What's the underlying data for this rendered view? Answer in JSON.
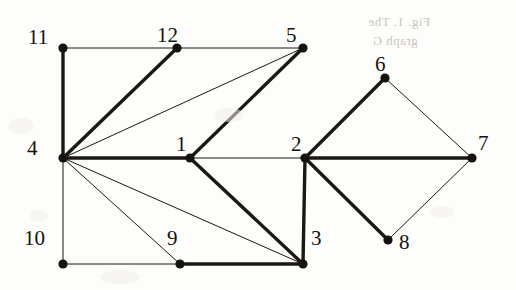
{
  "figure": {
    "type": "undirected-graph-diagram",
    "background_color": "#fdfdfb",
    "node_color": "#15120f",
    "edge_color": "#1a1714",
    "thick_edge_width": 3.4,
    "thin_edge_width": 1.0,
    "node_radius": 4.6
  },
  "nodes": [
    {
      "id": "11",
      "label": "11",
      "x": 63,
      "y": 48,
      "label_x": 28,
      "label_y": 27
    },
    {
      "id": "12",
      "label": "12",
      "x": 177,
      "y": 48,
      "label_x": 157,
      "label_y": 25
    },
    {
      "id": "5",
      "label": "5",
      "x": 303,
      "y": 48,
      "label_x": 286,
      "label_y": 25
    },
    {
      "id": "6",
      "label": "6",
      "x": 385,
      "y": 78,
      "label_x": 375,
      "label_y": 54
    },
    {
      "id": "4",
      "label": "4",
      "x": 63,
      "y": 158,
      "label_x": 27,
      "label_y": 138
    },
    {
      "id": "1",
      "label": "1",
      "x": 190,
      "y": 158,
      "label_x": 176,
      "label_y": 134
    },
    {
      "id": "2",
      "label": "2",
      "x": 305,
      "y": 158,
      "label_x": 291,
      "label_y": 134
    },
    {
      "id": "7",
      "label": "7",
      "x": 472,
      "y": 158,
      "label_x": 478,
      "label_y": 133
    },
    {
      "id": "8",
      "label": "8",
      "x": 388,
      "y": 240,
      "label_x": 399,
      "label_y": 232
    },
    {
      "id": "10",
      "label": "10",
      "x": 63,
      "y": 264,
      "label_x": 24,
      "label_y": 228
    },
    {
      "id": "9",
      "label": "9",
      "x": 180,
      "y": 264,
      "label_x": 167,
      "label_y": 228
    },
    {
      "id": "3",
      "label": "3",
      "x": 303,
      "y": 264,
      "label_x": 311,
      "label_y": 228
    }
  ],
  "edges": [
    {
      "from": "11",
      "to": "12",
      "weight": "thin"
    },
    {
      "from": "12",
      "to": "5",
      "weight": "thin"
    },
    {
      "from": "11",
      "to": "4",
      "weight": "thick"
    },
    {
      "from": "4",
      "to": "12",
      "weight": "thick"
    },
    {
      "from": "4",
      "to": "5",
      "weight": "thin"
    },
    {
      "from": "4",
      "to": "1",
      "weight": "thick"
    },
    {
      "from": "4",
      "to": "9",
      "weight": "thin"
    },
    {
      "from": "4",
      "to": "3",
      "weight": "thin"
    },
    {
      "from": "4",
      "to": "10",
      "weight": "thin"
    },
    {
      "from": "10",
      "to": "9",
      "weight": "thin"
    },
    {
      "from": "9",
      "to": "3",
      "weight": "thick"
    },
    {
      "from": "1",
      "to": "5",
      "weight": "thick"
    },
    {
      "from": "1",
      "to": "3",
      "weight": "thick"
    },
    {
      "from": "1",
      "to": "2",
      "weight": "thin"
    },
    {
      "from": "2",
      "to": "3",
      "weight": "thick"
    },
    {
      "from": "2",
      "to": "6",
      "weight": "thick"
    },
    {
      "from": "2",
      "to": "8",
      "weight": "thick"
    },
    {
      "from": "2",
      "to": "7",
      "weight": "thick"
    },
    {
      "from": "6",
      "to": "7",
      "weight": "thin"
    },
    {
      "from": "7",
      "to": "8",
      "weight": "thin"
    }
  ],
  "bleed_through": [
    {
      "text": "Fig. 1. The",
      "x": 368,
      "y": 14
    },
    {
      "text": "graph G",
      "x": 372,
      "y": 33
    }
  ],
  "smudges": [
    {
      "x": 8,
      "y": 118,
      "w": 26,
      "h": 16
    },
    {
      "x": 30,
      "y": 210,
      "w": 18,
      "h": 12
    },
    {
      "x": 214,
      "y": 108,
      "w": 30,
      "h": 14
    },
    {
      "x": 100,
      "y": 270,
      "w": 40,
      "h": 14
    },
    {
      "x": 430,
      "y": 206,
      "w": 24,
      "h": 12
    }
  ]
}
